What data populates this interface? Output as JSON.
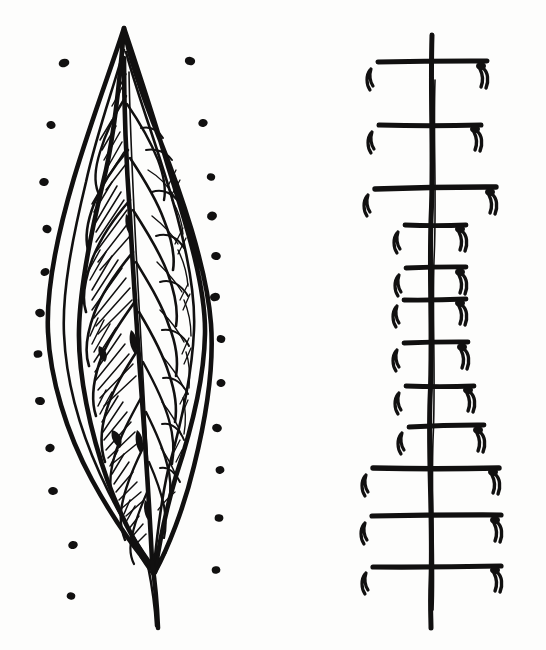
{
  "artwork": {
    "title": "Hand-drawn leaf with dot border and ladder diagram",
    "medium": "ink pen drawing",
    "background_color": "#fdfdfc",
    "ink_color": "#111010",
    "canvas": {
      "width": 546,
      "height": 650
    }
  },
  "figures": [
    {
      "id": "leaf-figure",
      "name": "lanceolate-leaf",
      "label": "leaf",
      "bbox": [
        36,
        24,
        232,
        628
      ],
      "description": "Elongated lanceolate leaf with double outline, central midrib, hatched lobes on left half, open cell outlines on right half, and a short stem at the base.",
      "tip_point": [
        124,
        26
      ],
      "stem_base_point": [
        157,
        628
      ],
      "widest_y": 330,
      "outline": {
        "left_x_at_widest": 48,
        "right_x_at_widest": 205,
        "stroke_width": 4
      },
      "midrib": {
        "name": "midrib",
        "top": [
          124,
          60
        ],
        "bottom": [
          152,
          565
        ],
        "stroke_width": 4.5
      },
      "vein_count_left": 11,
      "vein_count_right": 11,
      "hatching": {
        "side": "left",
        "angle_deg": 60,
        "line_count": 120
      }
    },
    {
      "id": "dots-figure",
      "name": "dot-border",
      "label": "dots",
      "description": "Two vertical columns of small ink dots flanking the leaf, bowing outward at the leaf's widest point.",
      "left_column": [
        {
          "cx": 64,
          "cy": 63,
          "rx": 5.4,
          "ry": 4.2,
          "rot": -16
        },
        {
          "cx": 51,
          "cy": 125,
          "rx": 4.6,
          "ry": 4.0,
          "rot": 8
        },
        {
          "cx": 44,
          "cy": 182,
          "rx": 4.8,
          "ry": 4.0,
          "rot": -10
        },
        {
          "cx": 47,
          "cy": 229,
          "rx": 4.6,
          "ry": 4.2,
          "rot": 14
        },
        {
          "cx": 45,
          "cy": 272,
          "rx": 4.6,
          "ry": 3.9,
          "rot": -22
        },
        {
          "cx": 40,
          "cy": 313,
          "rx": 4.9,
          "ry": 4.1,
          "rot": 18
        },
        {
          "cx": 38,
          "cy": 354,
          "rx": 4.4,
          "ry": 3.8,
          "rot": -6
        },
        {
          "cx": 40,
          "cy": 401,
          "rx": 5.0,
          "ry": 4.0,
          "rot": 10
        },
        {
          "cx": 50,
          "cy": 448,
          "rx": 4.7,
          "ry": 4.1,
          "rot": -14
        },
        {
          "cx": 53,
          "cy": 491,
          "rx": 4.9,
          "ry": 3.9,
          "rot": 6
        },
        {
          "cx": 73,
          "cy": 545,
          "rx": 4.8,
          "ry": 4.0,
          "rot": -12
        },
        {
          "cx": 71,
          "cy": 596,
          "rx": 4.3,
          "ry": 3.7,
          "rot": 16
        }
      ],
      "right_column": [
        {
          "cx": 190,
          "cy": 61,
          "rx": 5.2,
          "ry": 4.2,
          "rot": 12
        },
        {
          "cx": 203,
          "cy": 123,
          "rx": 4.7,
          "ry": 4.0,
          "rot": -8
        },
        {
          "cx": 211,
          "cy": 177,
          "rx": 4.2,
          "ry": 3.6,
          "rot": 20
        },
        {
          "cx": 212,
          "cy": 216,
          "rx": 5.0,
          "ry": 4.4,
          "rot": -18
        },
        {
          "cx": 216,
          "cy": 256,
          "rx": 4.8,
          "ry": 4.1,
          "rot": 6
        },
        {
          "cx": 215,
          "cy": 297,
          "rx": 5.0,
          "ry": 4.2,
          "rot": -12
        },
        {
          "cx": 221,
          "cy": 339,
          "rx": 4.3,
          "ry": 3.8,
          "rot": 14
        },
        {
          "cx": 221,
          "cy": 383,
          "rx": 4.5,
          "ry": 3.9,
          "rot": -6
        },
        {
          "cx": 217,
          "cy": 428,
          "rx": 4.9,
          "ry": 4.1,
          "rot": 10
        },
        {
          "cx": 220,
          "cy": 470,
          "rx": 4.4,
          "ry": 3.8,
          "rot": -16
        },
        {
          "cx": 219,
          "cy": 518,
          "rx": 4.4,
          "ry": 3.7,
          "rot": 8
        },
        {
          "cx": 216,
          "cy": 570,
          "rx": 4.3,
          "ry": 3.7,
          "rot": -10
        }
      ],
      "left_dot_count": 12,
      "right_dot_count": 12
    },
    {
      "id": "ladder-figure",
      "name": "ladder-diagram",
      "label": "ladder",
      "bbox": [
        360,
        35,
        505,
        630
      ],
      "description": "Vertical ink spine crossed by twelve horizontal bars of varying length; each bar end carries a small hooked tick mark.",
      "spine": {
        "name": "ladder-spine",
        "x": 432,
        "top_y": 35,
        "bottom_y": 628,
        "stroke_width": 5
      },
      "rungs": [
        {
          "index": 1,
          "y": 62,
          "x1": 378,
          "x2": 487,
          "thickness": 5.0,
          "left_tick": true,
          "right_tick": true
        },
        {
          "index": 2,
          "y": 125,
          "x1": 379,
          "x2": 481,
          "thickness": 5.0,
          "left_tick": true,
          "right_tick": true
        },
        {
          "index": 3,
          "y": 188,
          "x1": 375,
          "x2": 496,
          "thickness": 5.4,
          "left_tick": true,
          "right_tick": true
        },
        {
          "index": 4,
          "y": 225,
          "x1": 405,
          "x2": 466,
          "thickness": 4.8,
          "left_tick": true,
          "right_tick": true
        },
        {
          "index": 5,
          "y": 268,
          "x1": 406,
          "x2": 466,
          "thickness": 4.8,
          "left_tick": true,
          "right_tick": true
        },
        {
          "index": 6,
          "y": 299,
          "x1": 404,
          "x2": 466,
          "thickness": 4.8,
          "left_tick": true,
          "right_tick": true
        },
        {
          "index": 7,
          "y": 343,
          "x1": 404,
          "x2": 468,
          "thickness": 4.8,
          "left_tick": true,
          "right_tick": true
        },
        {
          "index": 8,
          "y": 386,
          "x1": 406,
          "x2": 474,
          "thickness": 4.8,
          "left_tick": true,
          "right_tick": true
        },
        {
          "index": 9,
          "y": 426,
          "x1": 409,
          "x2": 484,
          "thickness": 4.8,
          "left_tick": true,
          "right_tick": true
        },
        {
          "index": 10,
          "y": 468,
          "x1": 373,
          "x2": 499,
          "thickness": 5.4,
          "left_tick": true,
          "right_tick": true
        },
        {
          "index": 11,
          "y": 516,
          "x1": 372,
          "x2": 501,
          "thickness": 5.2,
          "left_tick": true,
          "right_tick": true
        },
        {
          "index": 12,
          "y": 566,
          "x1": 373,
          "x2": 501,
          "thickness": 5.2,
          "left_tick": true,
          "right_tick": true
        }
      ],
      "rung_count": 12
    }
  ]
}
